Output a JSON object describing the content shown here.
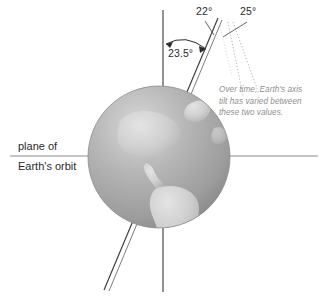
{
  "figure": {
    "background_color": "#ffffff"
  },
  "labels": {
    "angle_22": "22°",
    "angle_25": "25°",
    "angle_235": "23.5°",
    "plane_line_1": "plane of",
    "plane_line_2": "Earth's orbit"
  },
  "annotation": {
    "line_1": "Over time, Earth's axis",
    "line_2": "tilt has varied between",
    "line_3": "these two values.",
    "color": "#8f8f8f"
  },
  "colors": {
    "line": "#3a3a3a",
    "orbit_plane_line": "#8c8c8c",
    "dotted": "#b4b4b4",
    "ocean": "#a9a9a9",
    "ocean_light": "#cfcfcf",
    "ocean_dark": "#8e8e8e",
    "land": "#cbcbcb",
    "text": "#2b2b2b"
  },
  "elements": {
    "globe": "earth-globe",
    "vertical_axis": "orbital-normal-line",
    "tilted_axis": "earth-rotation-axis",
    "arc_arrow": "tilt-angle-arc",
    "dotted_bound_22": "tilt-bound-22-dotted",
    "dotted_bound_25": "tilt-bound-25-dotted"
  }
}
